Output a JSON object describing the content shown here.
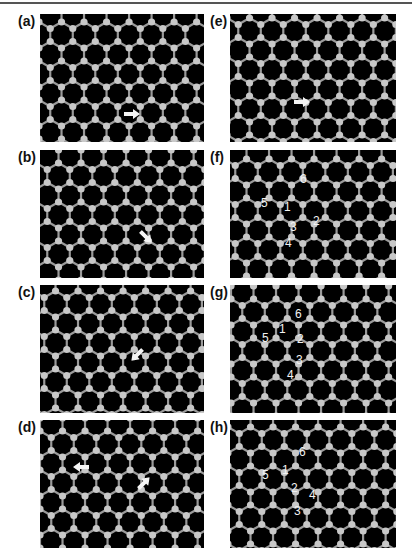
{
  "figure": {
    "panels": [
      {
        "id": "a",
        "label": "(a)",
        "column": "left",
        "row": 0,
        "arrows": [
          {
            "x": 92,
            "y": 100,
            "angle": 0
          }
        ],
        "numbers": []
      },
      {
        "id": "b",
        "label": "(b)",
        "column": "left",
        "row": 1,
        "arrows": [
          {
            "x": 106,
            "y": 87,
            "angle": 45
          }
        ],
        "numbers": []
      },
      {
        "id": "c",
        "label": "(c)",
        "column": "left",
        "row": 2,
        "arrows": [
          {
            "x": 97,
            "y": 70,
            "angle": 135
          }
        ],
        "numbers": []
      },
      {
        "id": "d",
        "label": "(d)",
        "column": "left",
        "row": 3,
        "arrows": [
          {
            "x": 41,
            "y": 47,
            "angle": 180
          },
          {
            "x": 104,
            "y": 63,
            "angle": -45
          }
        ],
        "numbers": []
      },
      {
        "id": "e",
        "label": "(e)",
        "column": "right",
        "row": 0,
        "arrows": [
          {
            "x": 72,
            "y": 88,
            "angle": 0
          }
        ],
        "numbers": []
      },
      {
        "id": "f",
        "label": "(f)",
        "column": "right",
        "row": 1,
        "arrows": [],
        "numbers": [
          {
            "text": "6",
            "x": 70,
            "y": 23
          },
          {
            "text": "5",
            "x": 31,
            "y": 47
          },
          {
            "text": "1",
            "x": 54,
            "y": 51
          },
          {
            "text": "2",
            "x": 83,
            "y": 65
          },
          {
            "text": "3",
            "x": 60,
            "y": 71
          },
          {
            "text": "4",
            "x": 55,
            "y": 87
          }
        ]
      },
      {
        "id": "g",
        "label": "(g)",
        "column": "right",
        "row": 2,
        "arrows": [],
        "numbers": [
          {
            "text": "6",
            "x": 65,
            "y": 23
          },
          {
            "text": "1",
            "x": 49,
            "y": 38
          },
          {
            "text": "5",
            "x": 32,
            "y": 47
          },
          {
            "text": "2",
            "x": 67,
            "y": 48
          },
          {
            "text": "3",
            "x": 66,
            "y": 69
          },
          {
            "text": "4",
            "x": 57,
            "y": 84
          }
        ]
      },
      {
        "id": "h",
        "label": "(h)",
        "column": "right",
        "row": 3,
        "arrows": [],
        "numbers": [
          {
            "text": "6",
            "x": 69,
            "y": 26
          },
          {
            "text": "1",
            "x": 52,
            "y": 44
          },
          {
            "text": "5",
            "x": 32,
            "y": 49
          },
          {
            "text": "2",
            "x": 61,
            "y": 62
          },
          {
            "text": "4",
            "x": 79,
            "y": 69
          },
          {
            "text": "3",
            "x": 64,
            "y": 85
          }
        ]
      }
    ]
  },
  "layout": {
    "left_panel_x": 40,
    "right_panel_x": 230,
    "panel_width": 164,
    "panel_width_right": 166,
    "row_tops": [
      14,
      150,
      285,
      420
    ],
    "panel_height": 128,
    "left_label_x": 18,
    "right_label_x": 210
  },
  "colors": {
    "background": "#ffffff",
    "panel": "#000000",
    "atom": "#c8c8c8",
    "bond": "#9a9a9a",
    "label": "#111111",
    "annotation": "#f2f2f2"
  }
}
